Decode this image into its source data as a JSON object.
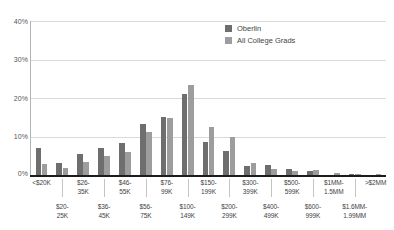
{
  "chart_data": {
    "type": "bar",
    "title": "",
    "subtitle": "",
    "xlabel": "",
    "ylabel": "",
    "ylim": [
      0,
      40
    ],
    "yticks": [
      0,
      10,
      20,
      30,
      40
    ],
    "ytick_labels": [
      "0%",
      "10%",
      "20%",
      "30%",
      "40%"
    ],
    "grid": true,
    "legend_position": "top-right",
    "categories": [
      "<$20K",
      "$20-25K",
      "$26-35K",
      "$36-45K",
      "$46-55K",
      "$56-75K",
      "$76-99K",
      "$100-149K",
      "$150-199K",
      "$200-299K",
      "$300-399K",
      "$400-499K",
      "$500-599K",
      "$600-999K",
      "$1MM-1.5MM",
      "$1.6MM-1.99MM",
      ">$2MM"
    ],
    "category_labels_display": [
      "<$20K",
      "$20-\n25K",
      "$26-\n35K",
      "$36-\n45K",
      "$46-\n55K",
      "$56-\n75K",
      "$76-\n99K",
      "$100-\n149K",
      "$150-\n199K",
      "$200-\n299K",
      "$300-\n399K",
      "$400-\n499K",
      "$500-\n599K",
      "$600-\n999K",
      "$1MM-\n1.5MM",
      "$1.6MM-\n1.99MM",
      ">$2MM"
    ],
    "series": [
      {
        "name": "Oberlin",
        "color": "#6e6e6e",
        "values": [
          6.9,
          3.2,
          5.4,
          7.1,
          8.2,
          13.2,
          15.0,
          21.1,
          8.5,
          6.3,
          2.4,
          2.5,
          1.5,
          1.0,
          0.0,
          0.2,
          0.0
        ]
      },
      {
        "name": "All College Grads",
        "color": "#9d9d9d",
        "values": [
          2.9,
          1.7,
          3.5,
          4.9,
          6.0,
          11.3,
          14.9,
          23.3,
          12.5,
          9.8,
          3.0,
          1.6,
          1.1,
          1.2,
          0.6,
          0.3,
          0.2
        ]
      }
    ]
  },
  "legend": {
    "items": [
      {
        "label": "Oberlin",
        "swatch": "series-a"
      },
      {
        "label": "All College Grads",
        "swatch": "series-b"
      }
    ]
  }
}
